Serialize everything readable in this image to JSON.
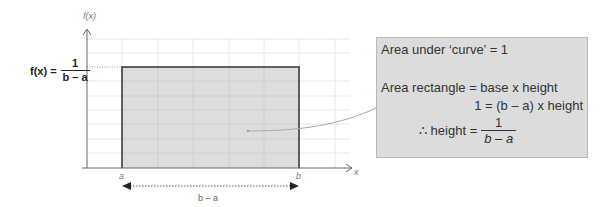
{
  "diagram": {
    "y_axis_label": "f(x)",
    "x_axis_label": "x",
    "lower_bound_label": "a",
    "upper_bound_label": "b",
    "width_label": "b – a",
    "height_equation": {
      "lhs": "f(x) =",
      "numerator": "1",
      "denominator": "b – a"
    },
    "colors": {
      "rectangle_fill": "#d9d9d9",
      "rectangle_stroke": "#333333",
      "grid": "#e6e6e6",
      "axis": "#666666",
      "callout_fill": "#dcdcdc",
      "leader_line": "#aaaaaa"
    }
  },
  "callout": {
    "line1": "Area under ‘curve’ = 1",
    "line2": "Area rectangle = base x height",
    "line3": "1 = (b – a) x height",
    "line4_prefix": "∴ height =",
    "line4_numerator": "1",
    "line4_denominator": "b – a"
  }
}
